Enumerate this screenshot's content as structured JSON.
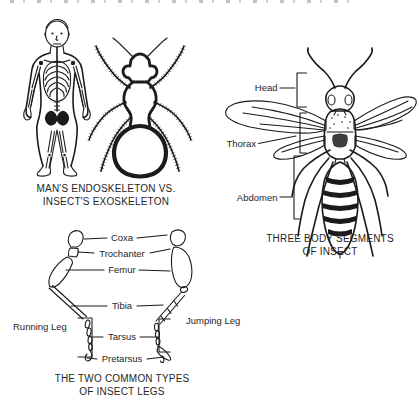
{
  "colors": {
    "paper": "#ffffff",
    "ink": "#1b1b1b",
    "text": "#262626"
  },
  "panel_skeletons": {
    "caption_line1": "MAN'S ENDOSKELETON VS.",
    "caption_line2": "INSECT'S EXOSKELETON"
  },
  "panel_body_segments": {
    "caption_line1": "THREE BODY SEGMENTS",
    "caption_line2": "OF INSECT",
    "labels": {
      "head": "Head",
      "thorax": "Thorax",
      "abdomen": "Abdomen"
    }
  },
  "panel_leg_types": {
    "caption_line1": "THE TWO COMMON TYPES",
    "caption_line2": "OF INSECT LEGS",
    "left_leg_label": "Running Leg",
    "right_leg_label": "Jumping Leg",
    "segments": [
      "Coxa",
      "Trochanter",
      "Femur",
      "Tibia",
      "Tarsus",
      "Pretarsus"
    ]
  }
}
